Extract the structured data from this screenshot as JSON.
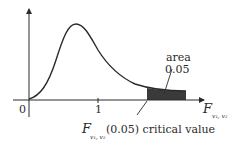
{
  "diagram": {
    "type": "F-distribution density curve",
    "axis_origin_label": "0",
    "axis_tick_label": "1",
    "x_axis_label": {
      "main": "F",
      "sub": "v₁, v₂"
    },
    "tail_annotation": {
      "line1": "area",
      "line2": "0.05"
    },
    "critical_value_annotation": {
      "main": "F",
      "sub": "v₁, v₂",
      "suffix": "(0.05) critical value"
    },
    "colors": {
      "curve": "#2a2a2a",
      "shaded_tail": "#3a3a3a",
      "axes": "#2a2a2a",
      "background": "#ffffff"
    }
  }
}
